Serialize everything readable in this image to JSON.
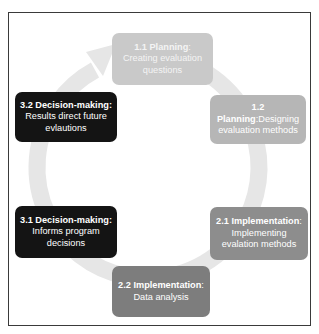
{
  "diagram": {
    "type": "cycle",
    "colors": {
      "ring": "#e6e6e6",
      "planning_1_1": "#c9c9c9",
      "planning_1_2": "#b6b6b6",
      "implementation_2_1": "#8d8d8d",
      "implementation_2_2": "#7d7d7d",
      "decision_making": "#141414",
      "text": "#ffffff"
    },
    "steps": [
      {
        "id": "1.1",
        "title": "1.1 Planning",
        "sep": ": ",
        "text": "Creating evaluation questions"
      },
      {
        "id": "1.2",
        "title": "1.2 Planning",
        "sep": ":",
        "text": "Designing evaluation methods"
      },
      {
        "id": "2.1",
        "title": "2.1 Implementation",
        "sep": ": ",
        "text": "Implementing evalation methods"
      },
      {
        "id": "2.2",
        "title": "2.2 Implementation",
        "sep": ": ",
        "text": "Data analysis"
      },
      {
        "id": "3.1",
        "title": "3.1 Decision-making:",
        "sep": " ",
        "text": "Informs program decisions"
      },
      {
        "id": "3.2",
        "title": "3.2 Decision-making:",
        "sep": " ",
        "text": "Results direct future evlautions"
      }
    ]
  }
}
